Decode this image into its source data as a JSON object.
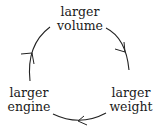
{
  "diagram": {
    "type": "cycle",
    "direction": "clockwise",
    "nodes": [
      {
        "id": "top",
        "line1": "larger",
        "line2": "volume"
      },
      {
        "id": "right",
        "line1": "larger",
        "line2": "weight"
      },
      {
        "id": "left",
        "line1": "larger",
        "line2": "engine"
      }
    ],
    "edges": [
      {
        "from": "larger volume",
        "to": "larger weight"
      },
      {
        "from": "larger weight",
        "to": "larger engine"
      },
      {
        "from": "larger engine",
        "to": "larger volume"
      }
    ],
    "colors": {
      "stroke": "#222222",
      "text": "#1a1a1a",
      "background": "#ffffff"
    }
  }
}
